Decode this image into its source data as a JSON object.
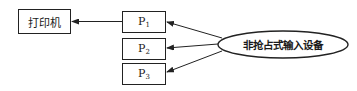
{
  "diagram": {
    "printer": {
      "label": "打印机"
    },
    "processes": [
      {
        "name": "P",
        "sub": "1",
        "top": 11
      },
      {
        "name": "P",
        "sub": "2",
        "top": 38
      },
      {
        "name": "P",
        "sub": "3",
        "top": 63
      }
    ],
    "device": {
      "label": "非抢占式输入设备"
    },
    "edges": [
      {
        "from": "P1",
        "to": "打印机"
      },
      {
        "from": "非抢占式输入设备",
        "to": "P1"
      },
      {
        "from": "非抢占式输入设备",
        "to": "P2"
      },
      {
        "from": "非抢占式输入设备",
        "to": "P3"
      }
    ],
    "colors": {
      "stroke": "#222222",
      "background": "#ffffff"
    }
  }
}
